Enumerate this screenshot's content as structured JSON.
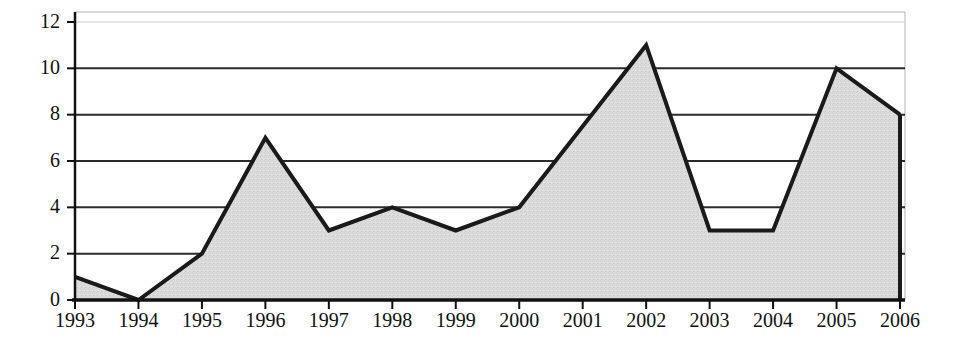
{
  "chart_data": {
    "type": "area",
    "title": "",
    "subtitle": "",
    "xlabel": "",
    "ylabel": "",
    "categories": [
      "1993",
      "1994",
      "1995",
      "1996",
      "1997",
      "1998",
      "1999",
      "2000",
      "2001",
      "2002",
      "2003",
      "2004",
      "2005",
      "2006"
    ],
    "values": [
      1,
      0,
      2,
      7,
      3,
      4,
      3,
      4,
      7.5,
      11,
      3,
      3,
      10,
      8
    ],
    "x": [
      1993,
      1994,
      1995,
      1996,
      1997,
      1998,
      1999,
      2000,
      2001,
      2002,
      2003,
      2004,
      2005,
      2006
    ],
    "ylim": [
      0,
      12
    ],
    "yticks": [
      0,
      2,
      4,
      6,
      8,
      10,
      12
    ],
    "ytick_labels": [
      "0",
      "2",
      "4",
      "6",
      "8",
      "10",
      "12"
    ],
    "xtick_labels": [
      "1993",
      "1994",
      "1995",
      "1996",
      "1997",
      "1998",
      "1999",
      "2000",
      "2001",
      "2002",
      "2003",
      "2004",
      "2005",
      "2006"
    ],
    "grid": true,
    "grid_axis": "y",
    "legend": false,
    "legend_position": "none",
    "annotations": [],
    "colors": {
      "line": "#1a1a1a",
      "fill": "#d9d9d9",
      "grid": "#2b2b2b",
      "axis": "#111111",
      "plot_border": "#9a9a9a",
      "background": "#ffffff",
      "text": "#111111"
    }
  }
}
